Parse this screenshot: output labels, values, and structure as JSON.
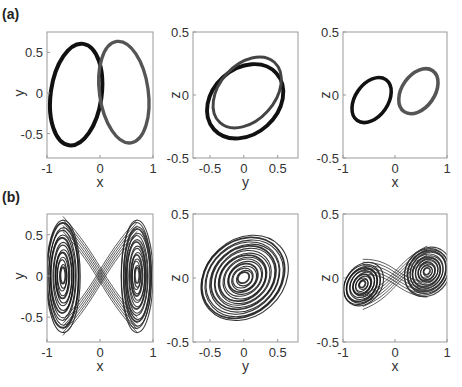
{
  "figure": {
    "row_labels": [
      "(a)",
      "(b)"
    ]
  },
  "chart_data": [
    {
      "panel": "(a)",
      "position": 1,
      "type": "line",
      "description": "Two-lobed (figure-eight) attractor projection, dark left lobe and gray right lobe, thick bands",
      "xlabel": "x",
      "ylabel": "y",
      "xlim": [
        -1,
        1
      ],
      "ylim": [
        -0.8,
        0.75
      ],
      "xticks": [
        -1,
        0,
        1
      ],
      "xticklabels": [
        "-1",
        "0",
        "1"
      ],
      "yticks": [
        -0.5,
        0,
        0.5
      ],
      "yticklabels": [
        "-0.5",
        "0",
        "0.5"
      ],
      "grid": false,
      "series": [
        {
          "name": "left lobe",
          "color": "#111111",
          "shape": "ellipse",
          "center": [
            -0.45,
            -0.02
          ],
          "rx": 0.48,
          "ry": 0.63,
          "tilt": -8,
          "band": 0.06
        },
        {
          "name": "right lobe",
          "color": "#555555",
          "shape": "ellipse",
          "center": [
            0.45,
            0.01
          ],
          "rx": 0.46,
          "ry": 0.63,
          "tilt": 8,
          "band": 0.05
        }
      ]
    },
    {
      "panel": "(a)",
      "position": 2,
      "type": "line",
      "description": "y–z projection: two overlapping tilted elliptical loops",
      "xlabel": "y",
      "ylabel": "z",
      "xlim": [
        -0.75,
        0.8
      ],
      "ylim": [
        -0.5,
        0.5
      ],
      "xticks": [
        -0.5,
        0,
        0.5
      ],
      "xticklabels": [
        "-0.5",
        "0",
        "0.5"
      ],
      "yticks": [
        -0.5,
        0,
        0.5
      ],
      "yticklabels": [
        "-0.5",
        "0",
        "0.5"
      ],
      "grid": false,
      "series": [
        {
          "name": "loop 1",
          "color": "#111111",
          "shape": "ellipse",
          "center": [
            0.02,
            -0.05
          ],
          "rx": 0.62,
          "ry": 0.26,
          "tilt": 42,
          "band": 0.04
        },
        {
          "name": "loop 2",
          "color": "#444444",
          "shape": "ellipse",
          "center": [
            0.05,
            0.02
          ],
          "rx": 0.6,
          "ry": 0.22,
          "tilt": 48,
          "band": 0.03
        }
      ]
    },
    {
      "panel": "(a)",
      "position": 3,
      "type": "line",
      "description": "x–z projection: two parallel tilted elongated loops",
      "xlabel": "x",
      "ylabel": "z",
      "xlim": [
        -1,
        1
      ],
      "ylim": [
        -0.5,
        0.5
      ],
      "xticks": [
        -1,
        0,
        1
      ],
      "xticklabels": [
        "-1",
        "0",
        "1"
      ],
      "yticks": [
        -0.5,
        0,
        0.5
      ],
      "yticklabels": [
        "-0.5",
        "0",
        "0.5"
      ],
      "grid": false,
      "series": [
        {
          "name": "left loop",
          "color": "#111111",
          "shape": "ellipse",
          "center": [
            -0.45,
            -0.04
          ],
          "rx": 0.48,
          "ry": 0.13,
          "tilt": 55,
          "band": 0.04
        },
        {
          "name": "right loop",
          "color": "#555555",
          "shape": "ellipse",
          "center": [
            0.45,
            0.03
          ],
          "rx": 0.48,
          "ry": 0.13,
          "tilt": 55,
          "band": 0.04
        }
      ]
    },
    {
      "panel": "(b)",
      "position": 1,
      "type": "line",
      "description": "Chaotic double-scroll attractor, x–y projection, spiraling around x≈±0.7",
      "xlabel": "x",
      "ylabel": "y",
      "xlim": [
        -1,
        1
      ],
      "ylim": [
        -0.8,
        0.75
      ],
      "xticks": [
        -1,
        0,
        1
      ],
      "xticklabels": [
        "-1",
        "0",
        "1"
      ],
      "yticks": [
        -0.5,
        0,
        0.5
      ],
      "yticklabels": [
        "-0.5",
        "0",
        "0.5"
      ],
      "grid": false,
      "series": [
        {
          "name": "left scroll",
          "color": "#111111",
          "shape": "spiral",
          "center": [
            -0.7,
            0.0
          ],
          "rx": 0.32,
          "ry": 0.68,
          "tilt": 0,
          "turns": 14
        },
        {
          "name": "right scroll",
          "color": "#222222",
          "shape": "spiral",
          "center": [
            0.7,
            0.0
          ],
          "rx": 0.3,
          "ry": 0.68,
          "tilt": 0,
          "turns": 16
        }
      ]
    },
    {
      "panel": "(b)",
      "position": 2,
      "type": "line",
      "description": "Chaotic attractor, y–z projection, dense concentric tilted ellipses",
      "xlabel": "y",
      "ylabel": "z",
      "xlim": [
        -0.75,
        0.8
      ],
      "ylim": [
        -0.5,
        0.5
      ],
      "xticks": [
        -0.5,
        0,
        0.5
      ],
      "xticklabels": [
        "-0.5",
        "0",
        "0.5"
      ],
      "yticks": [
        -0.5,
        0,
        0.5
      ],
      "yticklabels": [
        "-0.5",
        "0",
        "0.5"
      ],
      "grid": false,
      "series": [
        {
          "name": "scroll",
          "color": "#111111",
          "shape": "spiral",
          "center": [
            0.0,
            0.0
          ],
          "rx": 0.7,
          "ry": 0.3,
          "tilt": 42,
          "turns": 18
        }
      ]
    },
    {
      "panel": "(b)",
      "position": 3,
      "type": "line",
      "description": "Chaotic attractor, x–z projection, two tilted spiral scrolls",
      "xlabel": "x",
      "ylabel": "z",
      "xlim": [
        -1,
        1
      ],
      "ylim": [
        -0.5,
        0.5
      ],
      "xticks": [
        -1,
        0,
        1
      ],
      "xticklabels": [
        "-1",
        "0",
        "1"
      ],
      "yticks": [
        -0.5,
        0,
        0.5
      ],
      "yticklabels": [
        "-0.5",
        "0",
        "0.5"
      ],
      "grid": false,
      "series": [
        {
          "name": "left scroll",
          "color": "#111111",
          "shape": "spiral",
          "center": [
            -0.62,
            -0.05
          ],
          "rx": 0.45,
          "ry": 0.14,
          "tilt": 55,
          "turns": 12
        },
        {
          "name": "right scroll",
          "color": "#222222",
          "shape": "spiral",
          "center": [
            0.62,
            0.05
          ],
          "rx": 0.5,
          "ry": 0.17,
          "tilt": 55,
          "turns": 16
        }
      ]
    }
  ]
}
